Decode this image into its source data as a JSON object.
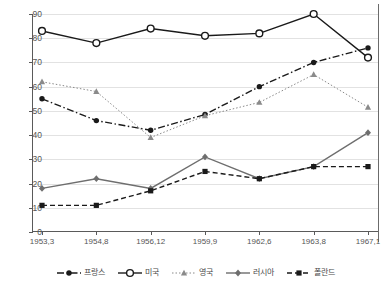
{
  "chart_data": {
    "type": "line",
    "title": "",
    "xlabel": "",
    "ylabel": "",
    "ylim": [
      0,
      90
    ],
    "ytick_step": 10,
    "grid": true,
    "legend_position": "bottom",
    "categories": [
      "1953,3",
      "1954,8",
      "1956,12",
      "1959,9",
      "1962,6",
      "1963,8",
      "1967,1"
    ],
    "ytick_labels": [
      "0",
      "10",
      "20",
      "30",
      "40",
      "50",
      "60",
      "70",
      "80",
      "90"
    ],
    "series": [
      {
        "name": "프랑스",
        "marker": "filled-circle",
        "line_style": "dash-dot",
        "color": "#1a1a1a",
        "values": [
          55,
          46,
          42,
          48.5,
          60,
          70,
          76
        ]
      },
      {
        "name": "미국",
        "marker": "open-circle",
        "line_style": "solid",
        "color": "#1a1a1a",
        "values": [
          83,
          78,
          84,
          81,
          82,
          90,
          72
        ]
      },
      {
        "name": "영국",
        "marker": "filled-triangle",
        "line_style": "dotted",
        "color": "#8a8a8a",
        "values": [
          62,
          58,
          39,
          48,
          53.5,
          65,
          51.5
        ]
      },
      {
        "name": "러시아",
        "marker": "filled-diamond",
        "line_style": "solid",
        "color": "#6e6e6e",
        "values": [
          18,
          22,
          18,
          31,
          22,
          27,
          41
        ]
      },
      {
        "name": "폴란드",
        "marker": "filled-square",
        "line_style": "dashed",
        "color": "#1a1a1a",
        "values": [
          11,
          11,
          17,
          25,
          22,
          27,
          27
        ]
      }
    ]
  }
}
